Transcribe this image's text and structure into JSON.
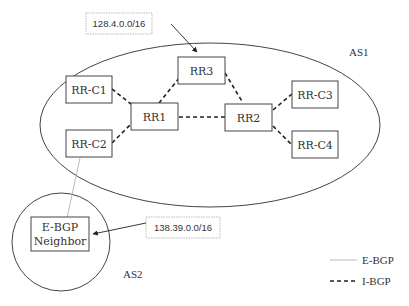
{
  "diagram": {
    "type": "bgp-route-reflector-topology",
    "autonomous_systems": [
      {
        "id": "as1",
        "label": "AS1"
      },
      {
        "id": "as2",
        "label": "AS2"
      }
    ],
    "nodes": [
      {
        "id": "rr1",
        "label": "RR1",
        "as": "AS1"
      },
      {
        "id": "rr2",
        "label": "RR2",
        "as": "AS1"
      },
      {
        "id": "rr3",
        "label": "RR3",
        "as": "AS1"
      },
      {
        "id": "rrc1",
        "label": "RR-C1",
        "as": "AS1"
      },
      {
        "id": "rrc2",
        "label": "RR-C2",
        "as": "AS1"
      },
      {
        "id": "rrc3",
        "label": "RR-C3",
        "as": "AS1"
      },
      {
        "id": "rrc4",
        "label": "RR-C4",
        "as": "AS1"
      },
      {
        "id": "ebgp",
        "label_line1": "E-BGP",
        "label_line2": "Neighbor",
        "as": "AS2"
      }
    ],
    "edges": [
      {
        "from": "RR1",
        "to": "RR-C1",
        "type": "I-BGP"
      },
      {
        "from": "RR1",
        "to": "RR-C2",
        "type": "I-BGP"
      },
      {
        "from": "RR1",
        "to": "RR3",
        "type": "I-BGP"
      },
      {
        "from": "RR1",
        "to": "RR2",
        "type": "I-BGP"
      },
      {
        "from": "RR2",
        "to": "RR3",
        "type": "I-BGP"
      },
      {
        "from": "RR2",
        "to": "RR-C3",
        "type": "I-BGP"
      },
      {
        "from": "RR2",
        "to": "RR-C4",
        "type": "I-BGP"
      },
      {
        "from": "RR-C2",
        "to": "E-BGP Neighbor",
        "type": "E-BGP"
      }
    ],
    "prefixes": [
      {
        "label": "128.4.0.0/16",
        "points_to": "RR3"
      },
      {
        "label": "138.39.0.0/16",
        "points_to": "E-BGP Neighbor"
      }
    ],
    "legend": [
      {
        "label": "E-BGP",
        "style": "thin solid gray"
      },
      {
        "label": "I-BGP",
        "style": "dashed black"
      }
    ],
    "colors": {
      "line": "#333333",
      "ebgp_line": "#999999",
      "prefix_border": "#aaaaaa"
    }
  }
}
